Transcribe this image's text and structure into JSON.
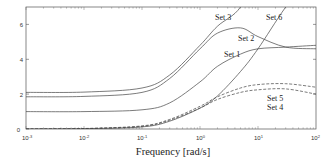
{
  "chart_data": {
    "type": "line",
    "title": "",
    "xlabel": "Frequency [rad/s]",
    "ylabel": "",
    "xscale": "log",
    "xlim": [
      0.001,
      100
    ],
    "ylim": [
      0,
      7
    ],
    "grid": false,
    "legend": "inline labels",
    "x_ticks": [
      {
        "base": "10",
        "exp": "-3",
        "value": 0.001
      },
      {
        "base": "10",
        "exp": "-2",
        "value": 0.01
      },
      {
        "base": "10",
        "exp": "-1",
        "value": 0.1
      },
      {
        "base": "10",
        "exp": "0",
        "value": 1
      },
      {
        "base": "10",
        "exp": "1",
        "value": 10
      },
      {
        "base": "10",
        "exp": "2",
        "value": 100
      }
    ],
    "y_ticks": [
      "0",
      "2",
      "4",
      "6"
    ],
    "x": [
      0.001,
      0.01,
      0.1,
      0.3,
      1,
      2,
      5,
      10,
      30,
      100
    ],
    "series": [
      {
        "name": "Set 1",
        "style": "solid",
        "values": [
          1.0,
          1.0,
          1.1,
          1.5,
          2.7,
          3.6,
          4.3,
          4.6,
          4.7,
          4.8
        ]
      },
      {
        "name": "Set 2",
        "style": "solid",
        "values": [
          1.85,
          1.87,
          2.1,
          2.9,
          4.6,
          5.5,
          5.8,
          5.3,
          4.7,
          4.6
        ]
      },
      {
        "name": "Set 3",
        "style": "solid",
        "values": [
          2.1,
          2.12,
          2.35,
          3.1,
          4.8,
          5.9,
          7.0,
          null,
          null,
          null
        ]
      },
      {
        "name": "Set 4",
        "style": "dashed",
        "values": [
          0.0,
          0.02,
          0.15,
          0.5,
          1.2,
          1.7,
          2.1,
          2.25,
          2.3,
          2.0
        ]
      },
      {
        "name": "Set 5",
        "style": "dashed",
        "values": [
          0.0,
          0.03,
          0.18,
          0.55,
          1.3,
          1.85,
          2.35,
          2.55,
          2.6,
          2.4
        ]
      },
      {
        "name": "Set 6",
        "style": "solid",
        "values": [
          0.0,
          0.02,
          0.12,
          0.45,
          1.2,
          1.9,
          3.3,
          4.6,
          7.0,
          null
        ]
      }
    ]
  },
  "labels": {
    "set1": "Set 1",
    "set2": "Set 2",
    "set3": "Set 3",
    "set4": "Set 4",
    "set5": "Set 5",
    "set6": "Set 6",
    "xaxis_title": "Frequency [rad/s]",
    "y0": "0",
    "y2": "2",
    "y4": "4",
    "y6": "6",
    "xbase": "10",
    "xexp_m3": "-3",
    "xexp_m2": "-2",
    "xexp_m1": "-1",
    "xexp_0": "0",
    "xexp_1": "1",
    "xexp_2": "2"
  }
}
